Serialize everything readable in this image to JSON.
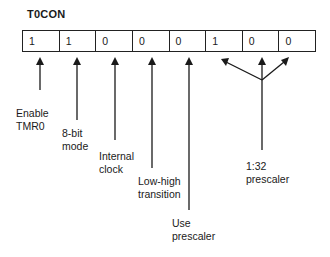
{
  "diagram": {
    "title": "T0CON",
    "bits": [
      "1",
      "1",
      "0",
      "0",
      "0",
      "1",
      "0",
      "0"
    ],
    "labels": {
      "enable": "Enable\nTMR0",
      "bit8": "8-bit\nmode",
      "internal": "Internal\nclock",
      "lowhigh": "Low-high\ntransition",
      "useprescaler": "Use\nprescaler",
      "prescale": "1:32\nprescaler"
    }
  }
}
